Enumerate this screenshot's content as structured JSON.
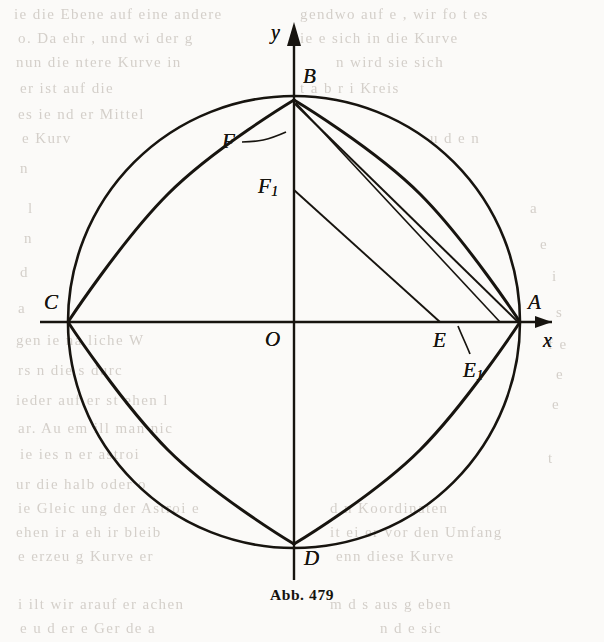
{
  "figure": {
    "caption": "Abb. 479",
    "axes": {
      "x_label": "x",
      "y_label": "y",
      "origin_label": "O"
    },
    "points": [
      {
        "name": "A",
        "label": "A",
        "sub": "",
        "x": 520,
        "y": 322,
        "label_x": 528,
        "label_y": 292
      },
      {
        "name": "B",
        "label": "B",
        "sub": "",
        "x": 294,
        "y": 100,
        "label_x": 303,
        "label_y": 66
      },
      {
        "name": "C",
        "label": "C",
        "sub": "",
        "x": 68,
        "y": 322,
        "label_x": 44,
        "label_y": 292
      },
      {
        "name": "D",
        "label": "D",
        "sub": "",
        "x": 294,
        "y": 544,
        "label_x": 304,
        "label_y": 548
      },
      {
        "name": "E",
        "label": "E",
        "sub": "",
        "x": 440,
        "y": 322,
        "label_x": 433,
        "label_y": 330
      },
      {
        "name": "E1",
        "label": "E",
        "sub": "1",
        "x": 468,
        "y": 356,
        "label_x": 463,
        "label_y": 360
      },
      {
        "name": "F",
        "label": "F",
        "sub": "",
        "x": 294,
        "y": 152,
        "label_x": 222,
        "label_y": 137
      },
      {
        "name": "F1",
        "label": "F",
        "sub": "1",
        "x": 294,
        "y": 190,
        "label_x": 258,
        "label_y": 180
      }
    ],
    "geometry": {
      "center_x": 294,
      "center_y": 322,
      "radius": 226,
      "shape": "astroid inscribed in circle",
      "cusps": [
        "A",
        "B",
        "C",
        "D"
      ],
      "tangent_segments": [
        {
          "from": "B",
          "to": "E",
          "note": "tangent chord through F"
        },
        {
          "from": "F1",
          "to": "E",
          "note": "shorter tangent chord"
        },
        {
          "from": "B",
          "to": "A",
          "note": "tangent chord along arc BA"
        }
      ]
    },
    "colors": {
      "ink": "#17140f",
      "paper": "#fbfaf8",
      "ghost": "#cfcac4"
    }
  },
  "ghost_text": {
    "lines": [
      {
        "text": "ie die Ebene auf eine andere",
        "x": 14,
        "y": 6,
        "size": 15
      },
      {
        "text": "gendwo auf e , wir fo t es",
        "x": 300,
        "y": 6,
        "size": 15
      },
      {
        "text": "o. Da ehr  , und wi  der  g",
        "x": 18,
        "y": 30,
        "size": 15
      },
      {
        "text": "ie  e sich  in  die  Kurve",
        "x": 300,
        "y": 30,
        "size": 15
      },
      {
        "text": "nun  die  ntere  Kurve  in",
        "x": 16,
        "y": 54,
        "size": 15
      },
      {
        "text": "n  wird  sie  sich",
        "x": 336,
        "y": 54,
        "size": 15
      },
      {
        "text": "er  ist  auf  die",
        "x": 20,
        "y": 80,
        "size": 15
      },
      {
        "text": "t  a  b  r  i  Kreis",
        "x": 300,
        "y": 80,
        "size": 15
      },
      {
        "text": "es  ie  nd  er  Mittel",
        "x": 18,
        "y": 106,
        "size": 15
      },
      {
        "text": "e  Kurv",
        "x": 22,
        "y": 130,
        "size": 15
      },
      {
        "text": "u  d  e  n",
        "x": 430,
        "y": 130,
        "size": 15
      },
      {
        "text": "n",
        "x": 20,
        "y": 160,
        "size": 15
      },
      {
        "text": "l",
        "x": 28,
        "y": 200,
        "size": 15
      },
      {
        "text": "a",
        "x": 530,
        "y": 200,
        "size": 15
      },
      {
        "text": "n",
        "x": 24,
        "y": 230,
        "size": 15
      },
      {
        "text": "e",
        "x": 540,
        "y": 236,
        "size": 15
      },
      {
        "text": "d",
        "x": 20,
        "y": 264,
        "size": 15
      },
      {
        "text": "i",
        "x": 552,
        "y": 268,
        "size": 15
      },
      {
        "text": "a",
        "x": 18,
        "y": 300,
        "size": 15
      },
      {
        "text": "s",
        "x": 556,
        "y": 304,
        "size": 15
      },
      {
        "text": "gen  ie  na  liche  W",
        "x": 16,
        "y": 332,
        "size": 15
      },
      {
        "text": "f  e",
        "x": 548,
        "y": 336,
        "size": 15
      },
      {
        "text": "rs  n  die  s  durc",
        "x": 18,
        "y": 362,
        "size": 15
      },
      {
        "text": "e",
        "x": 556,
        "y": 366,
        "size": 15
      },
      {
        "text": "ieder  auf  er  st  ehen  l",
        "x": 16,
        "y": 392,
        "size": 15
      },
      {
        "text": "e",
        "x": 552,
        "y": 396,
        "size": 15
      },
      {
        "text": "ar.  Au  em  ill  man  nic",
        "x": 18,
        "y": 420,
        "size": 15
      },
      {
        "text": "ie  ies  n  er  astroi",
        "x": 20,
        "y": 446,
        "size": 15
      },
      {
        "text": "t",
        "x": 548,
        "y": 450,
        "size": 15
      },
      {
        "text": "ur  die  halb  oder  o",
        "x": 16,
        "y": 476,
        "size": 15
      },
      {
        "text": "ie  Gleic  ung  der  Astroi  e",
        "x": 18,
        "y": 500,
        "size": 15
      },
      {
        "text": "d  n  Koordinaten",
        "x": 330,
        "y": 500,
        "size": 15
      },
      {
        "text": "ehen  ir  a  eh  ir  bleib",
        "x": 16,
        "y": 524,
        "size": 15
      },
      {
        "text": "it  ei  er  vor  den  Umfang",
        "x": 330,
        "y": 524,
        "size": 15
      },
      {
        "text": "e  erzeu  g  Kurve  er",
        "x": 18,
        "y": 548,
        "size": 15
      },
      {
        "text": "enn  diese  Kurve",
        "x": 336,
        "y": 548,
        "size": 15
      },
      {
        "text": "i  ilt  wir  arauf  er  achen",
        "x": 18,
        "y": 596,
        "size": 15
      },
      {
        "text": "m  d  s  aus  g  eben",
        "x": 330,
        "y": 596,
        "size": 15
      },
      {
        "text": "e  u  d  er  e  Ger  de  a",
        "x": 20,
        "y": 620,
        "size": 15
      },
      {
        "text": "n  d  e  sic",
        "x": 380,
        "y": 620,
        "size": 15
      }
    ]
  }
}
